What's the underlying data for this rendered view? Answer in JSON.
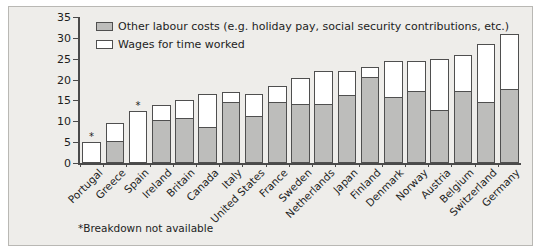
{
  "chart_data": {
    "type": "bar",
    "stacked": true,
    "title": "",
    "subtitle": "",
    "xlabel": "",
    "ylabel": "",
    "ylim": [
      0,
      35
    ],
    "yticks": [
      0,
      5,
      10,
      15,
      20,
      25,
      30,
      35
    ],
    "grid": false,
    "legend_position": "top-left",
    "categories": [
      "Portugal",
      "Greece",
      "Spain",
      "Ireland",
      "Britain",
      "Canada",
      "Italy",
      "United States",
      "France",
      "Sweden",
      "Netherlands",
      "Japan",
      "Finland",
      "Denmark",
      "Norway",
      "Austria",
      "Belgium",
      "Switzerland",
      "Germany"
    ],
    "series": [
      {
        "name": "Other labour costs (e.g. holiday pay, social security contributions, etc.)",
        "color": "#bdbdbb",
        "values": [
          null,
          5.0,
          null,
          10.0,
          10.5,
          8.5,
          14.5,
          11.0,
          14.5,
          14.0,
          14.0,
          16.0,
          20.5,
          15.5,
          17.0,
          12.5,
          17.0,
          14.5,
          17.5
        ]
      },
      {
        "name": "Wages for time worked",
        "color": "#ffffff",
        "values": [
          5.0,
          4.5,
          12.5,
          4.0,
          4.5,
          8.0,
          2.5,
          5.5,
          4.0,
          6.5,
          8.0,
          6.0,
          2.5,
          9.0,
          7.5,
          12.5,
          9.0,
          14.0,
          13.5
        ]
      }
    ],
    "totals": [
      5.0,
      9.5,
      12.5,
      14.0,
      15.0,
      16.5,
      17.0,
      16.5,
      18.5,
      20.5,
      22.0,
      22.0,
      23.0,
      24.5,
      24.5,
      25.0,
      26.0,
      28.5,
      31.0
    ],
    "no_breakdown": [
      "Portugal",
      "Spain"
    ],
    "no_breakdown_marker": "*",
    "footnote": "*Breakdown not available"
  },
  "legend": {
    "items": [
      {
        "label": "Other labour costs (e.g. holiday pay, social security contributions, etc.)"
      },
      {
        "label": "Wages for time worked"
      }
    ]
  },
  "axis": {
    "y_tick_labels": [
      "0",
      "5",
      "10",
      "15",
      "20",
      "25",
      "30",
      "35"
    ]
  },
  "footnote": {
    "text": "*Breakdown not available"
  }
}
